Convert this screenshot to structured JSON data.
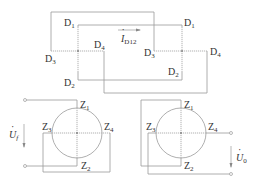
{
  "diagram": {
    "type": "circuit",
    "top_left_node": {
      "labels": [
        {
          "base": "D",
          "sub": "1"
        },
        {
          "base": "D",
          "sub": "2"
        },
        {
          "base": "D",
          "sub": "3"
        },
        {
          "base": "D",
          "sub": "4"
        }
      ]
    },
    "top_right_node": {
      "labels": [
        {
          "base": "D",
          "sub": "1"
        },
        {
          "base": "D",
          "sub": "2"
        },
        {
          "base": "D",
          "sub": "3"
        },
        {
          "base": "D",
          "sub": "4"
        }
      ]
    },
    "current_label": {
      "base": "I",
      "sub": "D12"
    },
    "bottom_left_element": {
      "labels": [
        {
          "base": "Z",
          "sub": "1"
        },
        {
          "base": "Z",
          "sub": "2"
        },
        {
          "base": "Z",
          "sub": "3"
        },
        {
          "base": "Z",
          "sub": "4"
        }
      ],
      "voltage_label": {
        "base": "U",
        "sub": "f"
      }
    },
    "bottom_right_element": {
      "labels": [
        {
          "base": "Z",
          "sub": "1"
        },
        {
          "base": "Z",
          "sub": "2"
        },
        {
          "base": "Z",
          "sub": "3"
        },
        {
          "base": "Z",
          "sub": "4"
        }
      ],
      "voltage_label": {
        "base": "U",
        "sub": "0"
      }
    },
    "colors": {
      "wire": "#9a9a9a",
      "text": "#333333"
    }
  }
}
